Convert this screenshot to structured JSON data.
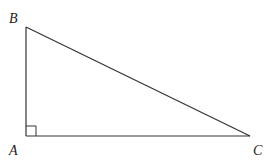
{
  "diagram": {
    "vertices": [
      {
        "label": "A",
        "x": 26,
        "y": 136
      },
      {
        "label": "B",
        "x": 26,
        "y": 27
      },
      {
        "label": "C",
        "x": 250,
        "y": 136
      }
    ],
    "right_angle_at": "A",
    "labels": {
      "a": "A",
      "b": "B",
      "c": "C"
    },
    "stroke_color": "#333333"
  }
}
